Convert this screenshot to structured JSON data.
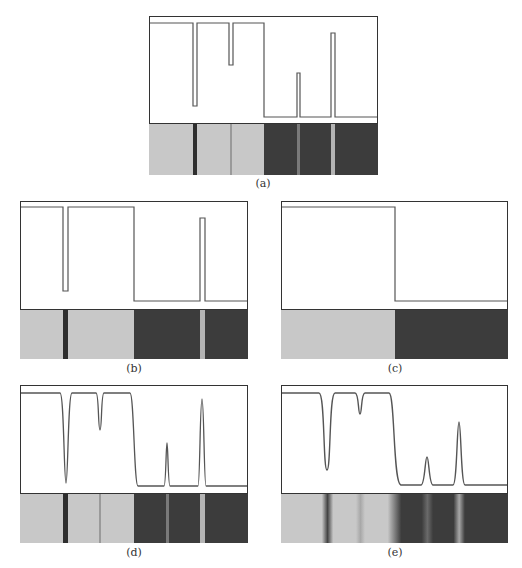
{
  "figure": {
    "panels": [
      {
        "id": "a",
        "caption": "(a)",
        "description": "Ideal step profile with narrow dark line, faint line, and two bright lines on dark region"
      },
      {
        "id": "b",
        "caption": "(b)",
        "description": "Step profile with one dark line and one bright line"
      },
      {
        "id": "c",
        "caption": "(c)",
        "description": "Single step edge from light to dark"
      },
      {
        "id": "d",
        "caption": "(d)",
        "description": "Smoothed version of (a) with sharp Gaussian-like peaks"
      },
      {
        "id": "e",
        "caption": "(e)",
        "description": "More heavily smoothed version of (a)"
      }
    ],
    "colors": {
      "light_strip": "#c8c8c8",
      "dark_strip": "#3c3c3c",
      "dark_line": "#2e2e2e",
      "faint_line": "#9a9a9a",
      "bright_line": "#b4b4b4",
      "profile_stroke": "#555555",
      "frame": "#333333"
    }
  }
}
